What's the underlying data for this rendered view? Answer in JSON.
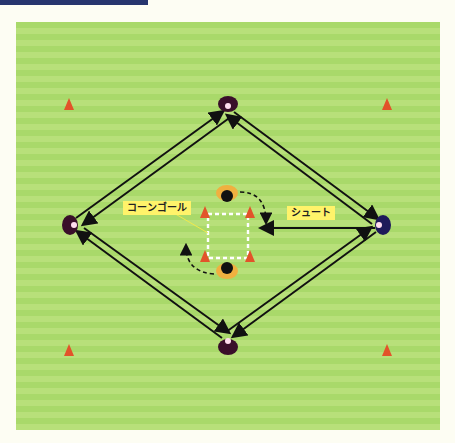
{
  "header": {
    "bar_color": "#27356e"
  },
  "field": {
    "stripe_light": "#b8e07a",
    "stripe_dark": "#a9d96a"
  },
  "labels": {
    "cone_goal": "コーンゴール",
    "shoot": "シュート"
  },
  "colors": {
    "label_bg": "#fff36a",
    "cone": "#e2532a",
    "arrow": "#111111"
  },
  "players": [
    {
      "id": "top",
      "x": 228,
      "y": 104
    },
    {
      "id": "left",
      "x": 70,
      "y": 225
    },
    {
      "id": "right",
      "x": 383,
      "y": 225
    },
    {
      "id": "bottom",
      "x": 228,
      "y": 345
    },
    {
      "id": "center-top",
      "x": 227,
      "y": 193
    },
    {
      "id": "center-bottom",
      "x": 227,
      "y": 270
    }
  ],
  "corner_cones": [
    {
      "x": 69,
      "y": 104
    },
    {
      "x": 387,
      "y": 104
    },
    {
      "x": 69,
      "y": 350
    },
    {
      "x": 387,
      "y": 350
    }
  ],
  "goal_cones": [
    {
      "x": 205,
      "y": 212
    },
    {
      "x": 250,
      "y": 212
    },
    {
      "x": 205,
      "y": 256
    },
    {
      "x": 250,
      "y": 256
    }
  ]
}
